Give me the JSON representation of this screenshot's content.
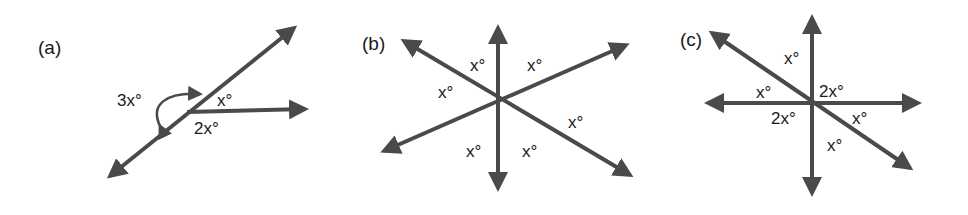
{
  "figure": {
    "line_color": "#4a4a4a",
    "panels": [
      {
        "label": "(a)",
        "angles": [
          "3x°",
          "x°",
          "2x°"
        ]
      },
      {
        "label": "(b)",
        "angles": [
          "x°",
          "x°",
          "x°",
          "x°",
          "x°",
          "x°"
        ]
      },
      {
        "label": "(c)",
        "angles": [
          "x°",
          "x°",
          "2x°",
          "2x°",
          "x°",
          "x°"
        ]
      }
    ]
  }
}
